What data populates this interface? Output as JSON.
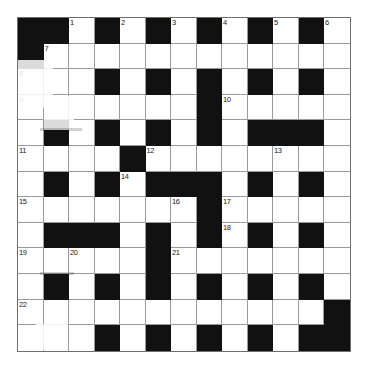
{
  "puzzle": {
    "title": "Crossword Grid",
    "rows": 13,
    "columns": 13,
    "cell_size_px": 25.5,
    "colors": {
      "block": "#111111",
      "cell": "#ffffff",
      "grid_line": "#9a9a9a",
      "number": "#1a1a1a"
    },
    "numbers_visible": [
      "1",
      "2",
      "3",
      "4",
      "5",
      "6",
      "7",
      "8",
      "9",
      "10",
      "11",
      "12",
      "13",
      "14",
      "15",
      "16",
      "17",
      "18",
      "19",
      "20",
      "21",
      "22"
    ],
    "grid": [
      [
        {
          "block": true
        },
        {
          "block": true
        },
        {
          "block": false,
          "number": "1"
        },
        {
          "block": true
        },
        {
          "block": false,
          "number": "2"
        },
        {
          "block": true
        },
        {
          "block": false,
          "number": "3"
        },
        {
          "block": true
        },
        {
          "block": false,
          "number": "4"
        },
        {
          "block": true
        },
        {
          "block": false,
          "number": "5"
        },
        {
          "block": true
        },
        {
          "block": false,
          "number": "6"
        }
      ],
      [
        {
          "block": true
        },
        {
          "block": false,
          "number": "7"
        },
        {
          "block": false
        },
        {
          "block": false
        },
        {
          "block": false
        },
        {
          "block": false
        },
        {
          "block": false
        },
        {
          "block": false
        },
        {
          "block": false
        },
        {
          "block": false
        },
        {
          "block": false
        },
        {
          "block": false
        },
        {
          "block": false
        }
      ],
      [
        {
          "block": false,
          "number": "8"
        },
        {
          "block": false
        },
        {
          "block": false
        },
        {
          "block": true
        },
        {
          "block": false
        },
        {
          "block": true
        },
        {
          "block": false
        },
        {
          "block": true
        },
        {
          "block": false
        },
        {
          "block": true
        },
        {
          "block": false
        },
        {
          "block": true
        },
        {
          "block": false
        }
      ],
      [
        {
          "block": false,
          "number": "9"
        },
        {
          "block": false
        },
        {
          "block": false
        },
        {
          "block": false
        },
        {
          "block": false
        },
        {
          "block": false
        },
        {
          "block": false
        },
        {
          "block": true
        },
        {
          "block": false,
          "number": "10"
        },
        {
          "block": false
        },
        {
          "block": false
        },
        {
          "block": false
        },
        {
          "block": false
        }
      ],
      [
        {
          "block": false
        },
        {
          "block": true
        },
        {
          "block": false
        },
        {
          "block": true
        },
        {
          "block": false
        },
        {
          "block": true
        },
        {
          "block": false
        },
        {
          "block": true
        },
        {
          "block": false
        },
        {
          "block": true
        },
        {
          "block": true
        },
        {
          "block": true
        },
        {
          "block": false
        }
      ],
      [
        {
          "block": false,
          "number": "11"
        },
        {
          "block": false
        },
        {
          "block": false
        },
        {
          "block": false
        },
        {
          "block": true
        },
        {
          "block": false,
          "number": "12"
        },
        {
          "block": false
        },
        {
          "block": false
        },
        {
          "block": false
        },
        {
          "block": false
        },
        {
          "block": false,
          "number": "13"
        },
        {
          "block": false
        },
        {
          "block": false
        }
      ],
      [
        {
          "block": false
        },
        {
          "block": true
        },
        {
          "block": false
        },
        {
          "block": true
        },
        {
          "block": false,
          "number": "14"
        },
        {
          "block": true
        },
        {
          "block": true
        },
        {
          "block": true
        },
        {
          "block": false
        },
        {
          "block": true
        },
        {
          "block": false
        },
        {
          "block": true
        },
        {
          "block": false
        }
      ],
      [
        {
          "block": false,
          "number": "15"
        },
        {
          "block": false
        },
        {
          "block": false
        },
        {
          "block": false
        },
        {
          "block": false
        },
        {
          "block": false
        },
        {
          "block": false,
          "number": "16"
        },
        {
          "block": true
        },
        {
          "block": false,
          "number": "17"
        },
        {
          "block": false
        },
        {
          "block": false
        },
        {
          "block": false
        },
        {
          "block": false
        }
      ],
      [
        {
          "block": false
        },
        {
          "block": true
        },
        {
          "block": true
        },
        {
          "block": true
        },
        {
          "block": false
        },
        {
          "block": true
        },
        {
          "block": false
        },
        {
          "block": true
        },
        {
          "block": false,
          "number": "18"
        },
        {
          "block": true
        },
        {
          "block": false
        },
        {
          "block": true
        },
        {
          "block": false
        }
      ],
      [
        {
          "block": false,
          "number": "19"
        },
        {
          "block": false
        },
        {
          "block": false,
          "number": "20"
        },
        {
          "block": false
        },
        {
          "block": false
        },
        {
          "block": true
        },
        {
          "block": false,
          "number": "21"
        },
        {
          "block": false
        },
        {
          "block": false
        },
        {
          "block": false
        },
        {
          "block": false
        },
        {
          "block": false
        },
        {
          "block": false
        }
      ],
      [
        {
          "block": false
        },
        {
          "block": true
        },
        {
          "block": false
        },
        {
          "block": true
        },
        {
          "block": false
        },
        {
          "block": true
        },
        {
          "block": false
        },
        {
          "block": true
        },
        {
          "block": false
        },
        {
          "block": true
        },
        {
          "block": false
        },
        {
          "block": true
        },
        {
          "block": false
        }
      ],
      [
        {
          "block": false,
          "number": "22"
        },
        {
          "block": false
        },
        {
          "block": false
        },
        {
          "block": false
        },
        {
          "block": false
        },
        {
          "block": false
        },
        {
          "block": false
        },
        {
          "block": false
        },
        {
          "block": false
        },
        {
          "block": false
        },
        {
          "block": false
        },
        {
          "block": false
        },
        {
          "block": true
        }
      ],
      [
        {
          "block": false
        },
        {
          "block": false
        },
        {
          "block": false
        },
        {
          "block": true
        },
        {
          "block": false
        },
        {
          "block": true
        },
        {
          "block": false
        },
        {
          "block": true
        },
        {
          "block": false
        },
        {
          "block": true
        },
        {
          "block": false
        },
        {
          "block": true
        },
        {
          "block": true
        }
      ]
    ]
  }
}
